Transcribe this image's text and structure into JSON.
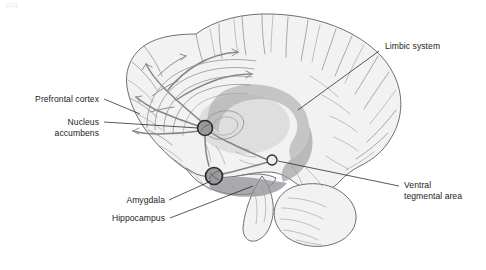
{
  "figure": {
    "title": "Limbic system and mesolimbic dopamine pathway (mid-sagittal brain)",
    "corner_mark": "074",
    "background_color": "#ffffff",
    "text_color": "#1d1d1d",
    "leader_line_color": "#111111",
    "brain_fill_color": "#f2f2f2",
    "brain_outline_color": "#6f6f73",
    "limbic_ring_color": "#a8a8ab",
    "limbic_ring_dark_color": "#8c8c90",
    "node_fill_color": "#9a9a9e",
    "node_stroke_color": "#2c2c2e",
    "vta_fill_color": "#efefef"
  },
  "labels": [
    {
      "id": "limbic-system",
      "name": "Limbic system",
      "lines": [
        "Limbic system"
      ],
      "align": "left",
      "text_x": 385,
      "text_y": 49,
      "leader": "M 379 51 L 298 110"
    },
    {
      "id": "prefrontal-cortex",
      "name": "Prefrontal cortex",
      "lines": [
        "Prefrontal cortex"
      ],
      "align": "right",
      "text_x": 99,
      "text_y": 102,
      "leader": "M 104 99 L 140 114"
    },
    {
      "id": "nucleus-accumbens",
      "name": "Nucleus accumbens",
      "lines": [
        "Nucleus",
        "accumbens"
      ],
      "align": "right",
      "text_x": 99,
      "text_y": 125,
      "leader": "M 104 122 L 198 128"
    },
    {
      "id": "amygdala",
      "name": "Amygdala",
      "lines": [
        "Amygdala"
      ],
      "align": "right",
      "text_x": 165,
      "text_y": 203,
      "leader": "M 169 200 L 211 180"
    },
    {
      "id": "hippocampus",
      "name": "Hippocampus",
      "lines": [
        "Hippocampus"
      ],
      "align": "right",
      "text_x": 165,
      "text_y": 221,
      "leader": "M 170 218 L 253 185"
    },
    {
      "id": "ventral-tegmental-area",
      "name": "Ventral tegmental area",
      "lines": [
        "Ventral",
        "tegmental area"
      ],
      "align": "left",
      "text_x": 404,
      "text_y": 188,
      "leader": "M 399 186 L 278 161"
    }
  ],
  "markers": [
    {
      "id": "nucleus-accumbens-node",
      "name": "nucleus accumbens",
      "cx": 205,
      "cy": 128,
      "r": 7.5,
      "style": "dark-ring"
    },
    {
      "id": "amygdala-node",
      "name": "amygdala",
      "cx": 214,
      "cy": 176,
      "r": 8.5,
      "style": "dark-ring"
    },
    {
      "id": "ventral-tegmental-area-node",
      "name": "ventral tegmental area",
      "cx": 272,
      "cy": 160,
      "r": 5.0,
      "style": "light-ring"
    }
  ]
}
